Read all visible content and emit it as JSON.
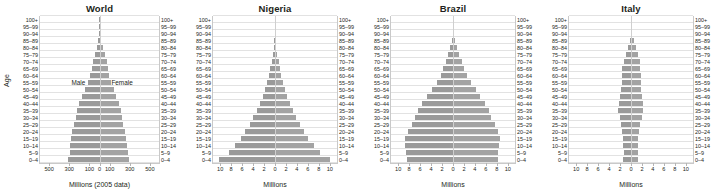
{
  "figure": {
    "axis_caption_y": "Age",
    "male_label": "Male",
    "female_label": "Female"
  },
  "chart_data": [
    {
      "type": "bar",
      "orientation": "population-pyramid",
      "title": "World",
      "xlabel": "Millions (2005 data)",
      "ylabel": "Age",
      "grid": true,
      "legend": [
        "Male",
        "Female"
      ],
      "xlim": [
        -600,
        600
      ],
      "xticks": [
        -500,
        -300,
        -100,
        0,
        100,
        300,
        500
      ],
      "xticklabels": [
        "500",
        "300",
        "100",
        "0",
        "100",
        "300",
        "500"
      ],
      "categories": [
        "0–4",
        "5–9",
        "10–14",
        "15–19",
        "20–24",
        "25–29",
        "30–34",
        "35–39",
        "40–44",
        "45–49",
        "50–54",
        "55–59",
        "60–64",
        "65–69",
        "70–74",
        "75–79",
        "80–84",
        "85–89",
        "90–94",
        "95–99",
        "100+"
      ],
      "series": [
        {
          "name": "Male",
          "values": [
            313,
            300,
            297,
            287,
            273,
            254,
            238,
            226,
            203,
            172,
            146,
            118,
            97,
            78,
            62,
            43,
            25,
            11,
            4,
            1,
            0.2
          ]
        },
        {
          "name": "Female",
          "values": [
            295,
            283,
            280,
            271,
            259,
            242,
            228,
            218,
            197,
            168,
            144,
            118,
            100,
            84,
            71,
            54,
            35,
            18,
            7,
            2,
            0.4
          ]
        }
      ]
    },
    {
      "type": "bar",
      "orientation": "population-pyramid",
      "title": "Nigeria",
      "xlabel": "Millions",
      "ylabel": "Age",
      "grid": true,
      "legend": [
        "Male",
        "Female"
      ],
      "xlim": [
        -11.5,
        11.5
      ],
      "xticks": [
        -10,
        -8,
        -6,
        -4,
        -2,
        0,
        2,
        4,
        6,
        8,
        10
      ],
      "xticklabels": [
        "10",
        "8",
        "6",
        "4",
        "2",
        "0",
        "2",
        "4",
        "6",
        "8",
        "10"
      ],
      "categories": [
        "0–4",
        "5–9",
        "10–14",
        "15–19",
        "20–24",
        "25–29",
        "30–34",
        "35–39",
        "40–44",
        "45–49",
        "50–54",
        "55–59",
        "60–64",
        "65–69",
        "70–74",
        "75–79",
        "80–84",
        "85–89",
        "90–94",
        "95–99",
        "100+"
      ],
      "series": [
        {
          "name": "Male",
          "values": [
            10.4,
            8.6,
            7.4,
            6.4,
            5.5,
            4.7,
            4.0,
            3.4,
            2.8,
            2.3,
            1.9,
            1.5,
            1.2,
            0.9,
            0.6,
            0.4,
            0.22,
            0.1,
            0.03,
            0.01,
            0.002
          ]
        },
        {
          "name": "Female",
          "values": [
            10.2,
            8.4,
            7.2,
            6.2,
            5.4,
            4.6,
            3.9,
            3.3,
            2.8,
            2.3,
            1.9,
            1.5,
            1.2,
            0.9,
            0.65,
            0.42,
            0.24,
            0.11,
            0.035,
            0.012,
            0.003
          ]
        }
      ]
    },
    {
      "type": "bar",
      "orientation": "population-pyramid",
      "title": "Brazil",
      "xlabel": "Millions",
      "ylabel": "Age",
      "grid": true,
      "legend": [
        "Male",
        "Female"
      ],
      "xlim": [
        -11.5,
        11.5
      ],
      "xticks": [
        -10,
        -8,
        -6,
        -4,
        -2,
        0,
        2,
        4,
        6,
        8,
        10
      ],
      "xticklabels": [
        "10",
        "8",
        "6",
        "4",
        "2",
        "0",
        "2",
        "4",
        "6",
        "8",
        "10"
      ],
      "categories": [
        "0–4",
        "5–9",
        "10–14",
        "15–19",
        "20–24",
        "25–29",
        "30–34",
        "35–39",
        "40–44",
        "45–49",
        "50–54",
        "55–59",
        "60–64",
        "65–69",
        "70–74",
        "75–79",
        "80–84",
        "85–89",
        "90–94",
        "95–99",
        "100+"
      ],
      "series": [
        {
          "name": "Male",
          "values": [
            8.6,
            8.7,
            8.9,
            8.9,
            8.4,
            7.6,
            7.0,
            6.5,
            5.7,
            4.8,
            3.9,
            3.0,
            2.3,
            1.8,
            1.3,
            0.9,
            0.5,
            0.25,
            0.09,
            0.02,
            0.004
          ]
        },
        {
          "name": "Female",
          "values": [
            8.3,
            8.4,
            8.6,
            8.7,
            8.3,
            7.7,
            7.1,
            6.7,
            5.9,
            5.0,
            4.2,
            3.3,
            2.6,
            2.1,
            1.6,
            1.2,
            0.75,
            0.4,
            0.15,
            0.04,
            0.008
          ]
        }
      ]
    },
    {
      "type": "bar",
      "orientation": "population-pyramid",
      "title": "Italy",
      "xlabel": "Millions",
      "ylabel": "Age",
      "grid": true,
      "legend": [
        "Male",
        "Female"
      ],
      "xlim": [
        -11.5,
        11.5
      ],
      "xticks": [
        -10,
        -8,
        -6,
        -4,
        -2,
        0,
        2,
        4,
        6,
        8,
        10
      ],
      "xticklabels": [
        "10",
        "8",
        "6",
        "4",
        "2",
        "0",
        "2",
        "4",
        "6",
        "8",
        "10"
      ],
      "categories": [
        "0–4",
        "5–9",
        "10–14",
        "15–19",
        "20–24",
        "25–29",
        "30–34",
        "35–39",
        "40–44",
        "45–49",
        "50–54",
        "55–59",
        "60–64",
        "65–69",
        "70–74",
        "75–79",
        "80–84",
        "85–89",
        "90–94",
        "95–99",
        "100+"
      ],
      "series": [
        {
          "name": "Male",
          "values": [
            1.4,
            1.38,
            1.4,
            1.45,
            1.58,
            1.8,
            2.1,
            2.35,
            2.3,
            2.0,
            1.85,
            1.75,
            1.7,
            1.6,
            1.35,
            1.0,
            0.62,
            0.28,
            0.09,
            0.02,
            0.003
          ]
        },
        {
          "name": "Female",
          "values": [
            1.33,
            1.31,
            1.33,
            1.38,
            1.52,
            1.75,
            2.05,
            2.3,
            2.28,
            2.0,
            1.88,
            1.82,
            1.8,
            1.75,
            1.58,
            1.32,
            0.95,
            0.52,
            0.2,
            0.05,
            0.01
          ]
        }
      ]
    }
  ]
}
